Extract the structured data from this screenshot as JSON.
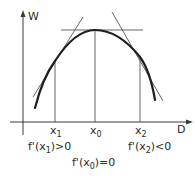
{
  "diagram": {
    "axes": {
      "y_label": "W",
      "x_label": "D"
    },
    "points": {
      "x1": {
        "name": "x",
        "sub": "1"
      },
      "x0": {
        "name": "x",
        "sub": "0"
      },
      "x2": {
        "name": "x",
        "sub": "2"
      }
    },
    "annotations": {
      "left": {
        "pre": "f'(x",
        "sub": "1",
        "post": ")>0"
      },
      "right": {
        "pre": "f'(x",
        "sub": "2",
        "post": ")<0"
      },
      "center": {
        "pre": "f'(x",
        "sub": "0",
        "post": ")=0"
      }
    },
    "colors": {
      "line": "#3a3a3a",
      "curve": "#1e1e1e"
    }
  }
}
